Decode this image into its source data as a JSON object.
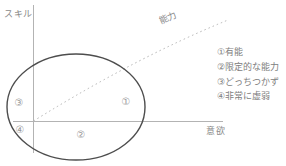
{
  "labels": {
    "y_axis": "スキル",
    "x_axis": "意欲",
    "diagonal": "能力"
  },
  "markers": {
    "m1": "①",
    "m2": "②",
    "m3": "③",
    "m4": "④"
  },
  "legend": {
    "items": [
      "①有能",
      "②限定的な能力",
      "③どっちつかず",
      "④非常に虚弱"
    ]
  },
  "colors": {
    "axis": "#b3b3b3",
    "dotted_line": "#b3b3b3",
    "ellipse": "#4d4d4d",
    "label_text": "#8a8a8a",
    "legend_text": "#808080",
    "marker_text": "#9a9a9a"
  }
}
